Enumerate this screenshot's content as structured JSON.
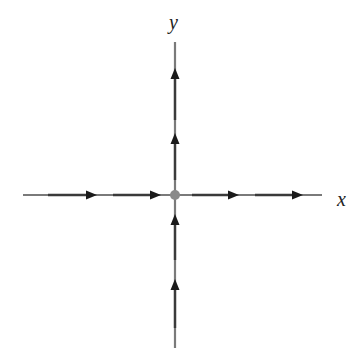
{
  "diagram": {
    "type": "phase-portrait",
    "labels": {
      "x_axis": "x",
      "y_axis": "y"
    },
    "colors": {
      "line": "#7a7a7a",
      "arrow": "#1a1a1a",
      "origin": "#8a8a8a",
      "text": "#222222"
    },
    "origin": {
      "cx": 175,
      "cy": 195,
      "r": 5
    },
    "axes": {
      "horizontal": {
        "x1": 23,
        "x2": 322,
        "y": 195
      },
      "vertical": {
        "x": 175,
        "y1": 42,
        "y2": 348
      }
    },
    "arrows": [
      {
        "id": "x-left-1",
        "x": 93,
        "y": 195,
        "dir": "right"
      },
      {
        "id": "x-left-2",
        "x": 157,
        "y": 195,
        "dir": "right"
      },
      {
        "id": "x-right-1",
        "x": 232,
        "y": 195,
        "dir": "right"
      },
      {
        "id": "x-right-2",
        "x": 298,
        "y": 195,
        "dir": "right"
      },
      {
        "id": "y-upper-1",
        "x": 175,
        "y": 72,
        "dir": "up"
      },
      {
        "id": "y-upper-2",
        "x": 175,
        "y": 137,
        "dir": "up"
      },
      {
        "id": "y-lower-1",
        "x": 175,
        "y": 218,
        "dir": "up"
      },
      {
        "id": "y-lower-2",
        "x": 175,
        "y": 283,
        "dir": "up"
      }
    ]
  }
}
